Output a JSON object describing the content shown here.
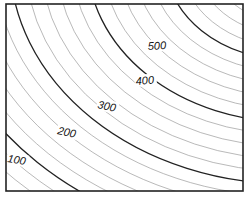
{
  "diagram": {
    "type": "contour-map",
    "frame": {
      "x": 6,
      "y": 4,
      "width": 237,
      "height": 187
    },
    "center": {
      "x": 290,
      "y": -40
    },
    "contour_interval": 20,
    "index_interval": 100,
    "index_color": "#222222",
    "minor_color": "#8a8a8a",
    "labels": [
      {
        "text": "500",
        "x": 148,
        "y": 50,
        "angle": -3
      },
      {
        "text": "400",
        "x": 136,
        "y": 85,
        "angle": -5
      },
      {
        "text": "300",
        "x": 97,
        "y": 108,
        "angle": 12
      },
      {
        "text": "200",
        "x": 57,
        "y": 134,
        "angle": 12
      },
      {
        "text": "100",
        "x": 7,
        "y": 162,
        "angle": 10
      }
    ]
  }
}
